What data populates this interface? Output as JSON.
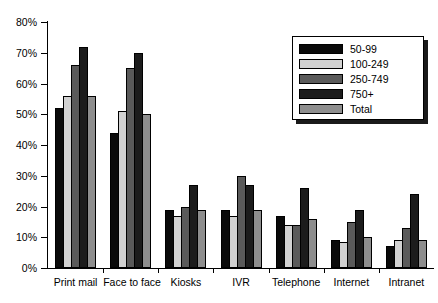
{
  "chart_data": {
    "type": "bar",
    "title": "",
    "xlabel": "",
    "ylabel": "",
    "ylim": [
      0,
      80
    ],
    "ytick_labels": [
      "0%",
      "10%",
      "20%",
      "30%",
      "40%",
      "50%",
      "60%",
      "70%",
      "80%"
    ],
    "yticks": [
      0,
      10,
      20,
      30,
      40,
      50,
      60,
      70,
      80
    ],
    "grid": false,
    "legend_position": "top-right",
    "categories": [
      "Print mail",
      "Face to face",
      "Kiosks",
      "IVR",
      "Telephone",
      "Internet",
      "Intranet"
    ],
    "series": [
      {
        "name": "50-99",
        "color": "#0a0a0a",
        "values": [
          52,
          44,
          19,
          19,
          17,
          9,
          7
        ]
      },
      {
        "name": "100-249",
        "color": "#d2d2d2",
        "values": [
          56,
          51,
          17,
          17,
          14,
          8.5,
          9
        ]
      },
      {
        "name": "250-749",
        "color": "#5a5a5a",
        "values": [
          66,
          65,
          20,
          30,
          14,
          15,
          13
        ]
      },
      {
        "name": "750+",
        "color": "#1c1c1c",
        "values": [
          72,
          70,
          27,
          27,
          26,
          19,
          24
        ]
      },
      {
        "name": "Total",
        "color": "#8e8e8e",
        "values": [
          56,
          50,
          19,
          19,
          16,
          10,
          9
        ]
      }
    ]
  }
}
